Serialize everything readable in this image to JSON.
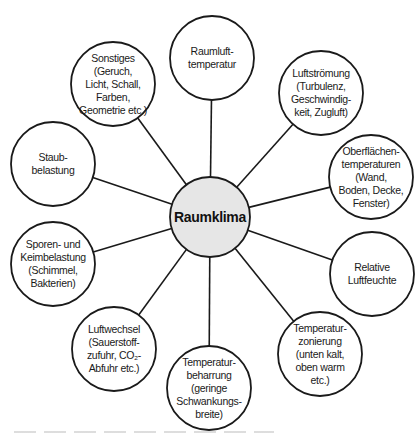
{
  "diagram": {
    "type": "mind-map",
    "center": {
      "label": "Raumklima",
      "x": 210,
      "y": 217,
      "r": 40,
      "fill": "#e6e6e6"
    },
    "nodes": [
      {
        "id": "raumlufttemperatur",
        "label": "Raumluft-\ntemperatur",
        "x": 212,
        "y": 58,
        "r": 42
      },
      {
        "id": "luftstroemung",
        "label": "Luftströmung\n(Turbulenz,\nGeschwindig-\nkeit, Zugluft)",
        "x": 321,
        "y": 93,
        "r": 42
      },
      {
        "id": "oberflaechentemperaturen",
        "label": "Oberflächen-\ntemperaturen\n(Wand,\nBoden, Decke,\nFenster)",
        "x": 371,
        "y": 177,
        "r": 42
      },
      {
        "id": "relative-luftfeuchte",
        "label": "Relative\nLuftfeuchte",
        "x": 372,
        "y": 274,
        "r": 42
      },
      {
        "id": "temperaturzonierung",
        "label": "Temperatur-\nzonierung\n(unten kalt,\noben warm\netc.)",
        "x": 320,
        "y": 354,
        "r": 42
      },
      {
        "id": "temperaturbeharrung",
        "label": "Temperatur-\nbeharrung\n(geringe\nSchwankungs-\nbreite)",
        "x": 209,
        "y": 388,
        "r": 42
      },
      {
        "id": "luftwechsel",
        "label": "Luftwechsel\n(Sauerstoff-\nzufuhr, CO₂-\nAbfuhr etc.)",
        "x": 114,
        "y": 349,
        "r": 42
      },
      {
        "id": "sporen-keimbelastung",
        "label": "Sporen- und\nKeimbelastung\n(Schimmel,\nBakterien)",
        "x": 53,
        "y": 264,
        "r": 42
      },
      {
        "id": "staubbelastung",
        "label": "Staub-\nbelastung",
        "x": 53,
        "y": 164,
        "r": 42
      },
      {
        "id": "sonstiges",
        "label": "Sonstiges\n(Geruch,\nLicht, Schall,\nFarben,\nGeometrie etc.)",
        "x": 113,
        "y": 84,
        "r": 42
      }
    ],
    "edges": [
      {
        "from": "Raumklima",
        "to": "raumlufttemperatur"
      },
      {
        "from": "Raumklima",
        "to": "luftstroemung"
      },
      {
        "from": "Raumklima",
        "to": "oberflaechentemperaturen"
      },
      {
        "from": "Raumklima",
        "to": "relative-luftfeuchte"
      },
      {
        "from": "Raumklima",
        "to": "temperaturzonierung"
      },
      {
        "from": "Raumklima",
        "to": "temperaturbeharrung"
      },
      {
        "from": "Raumklima",
        "to": "luftwechsel"
      },
      {
        "from": "Raumklima",
        "to": "sporen-keimbelastung"
      },
      {
        "from": "Raumklima",
        "to": "staubbelastung"
      },
      {
        "from": "Raumklima",
        "to": "sonstiges"
      }
    ],
    "colors": {
      "stroke": "#1a1a1a",
      "node_fill": "#ffffff",
      "center_fill": "#e6e6e6",
      "background": "#ffffff"
    }
  }
}
